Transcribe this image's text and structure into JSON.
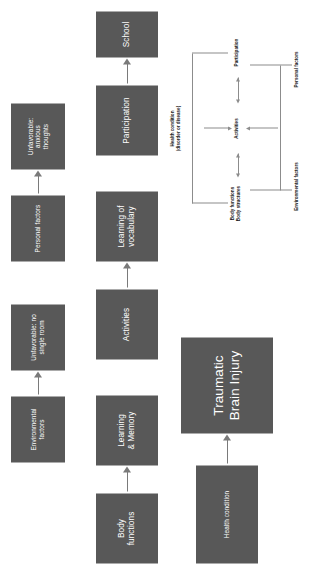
{
  "figure": {
    "type": "flow-diagram",
    "orientation": "rotated-90-ccw",
    "box_color": "#585858",
    "box_text_color": "#ffffff",
    "arrow_color": "#7a7a7a",
    "background": "#ffffff"
  },
  "rows": {
    "row1": {
      "source_label": "Health condition",
      "target_label": "Traumatic\nBrain Injury",
      "target_line1": "Traumatic",
      "target_line2": "Brain Injury"
    },
    "row2a": {
      "source_label": "Body\nfunctions",
      "source_line1": "Body",
      "source_line2": "functions",
      "target_line1": "Learning",
      "target_line2": "& Memory"
    },
    "row2b": {
      "source_label": "Activities",
      "target_line1": "Learning of",
      "target_line2": "vocabulary"
    },
    "row2c": {
      "source_label": "Participation",
      "target_label": "School"
    },
    "row3a": {
      "source_line1": "Environmental",
      "source_line2": "factors",
      "target_line1": "Unfavorable: no",
      "target_line2": "single room"
    },
    "row3b": {
      "source_label": "Personal factors",
      "target_line1": "Unfavorable:",
      "target_line2": "anxious",
      "target_line3": "thoughts"
    }
  },
  "icf_model": {
    "title_line1": "Health condition",
    "title_line2": "(disorder or disease)",
    "body_line1": "Body functions",
    "body_line2": "Body structures",
    "activities": "Activities",
    "participation": "Participation",
    "environmental": "Environmental factors",
    "personal": "Personal factors"
  }
}
